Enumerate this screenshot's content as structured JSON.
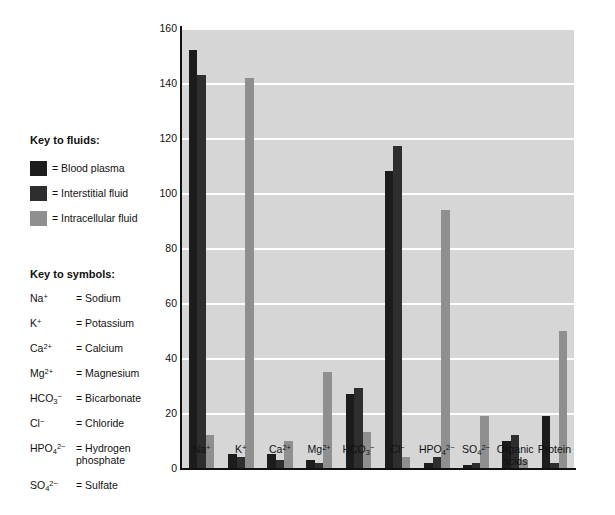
{
  "key_fluids": {
    "heading": "Key to fluids:",
    "items": [
      {
        "label": "= Blood plasma",
        "swatch_name": "blood-plasma-swatch",
        "color": "#1c1c1c"
      },
      {
        "label": "= Interstitial fluid",
        "swatch_name": "interstitial-swatch",
        "color": "#2e2e2e"
      },
      {
        "label": "= Intracellular fluid",
        "swatch_name": "intracellular-swatch",
        "color": "#8f8f8f"
      }
    ]
  },
  "key_symbols": {
    "heading": "Key to symbols:",
    "items": [
      {
        "ion_base": "Na",
        "ion_sup": "+",
        "ion_sub": "",
        "name": "= Sodium"
      },
      {
        "ion_base": "K",
        "ion_sup": "+",
        "ion_sub": "",
        "name": "= Potassium"
      },
      {
        "ion_base": "Ca",
        "ion_sup": "2+",
        "ion_sub": "",
        "name": "= Calcium"
      },
      {
        "ion_base": "Mg",
        "ion_sup": "2+",
        "ion_sub": "",
        "name": "= Magnesium"
      },
      {
        "ion_base": "HCO",
        "ion_sup": "−",
        "ion_sub": "3",
        "name": "= Bicarbonate"
      },
      {
        "ion_base": "Cl",
        "ion_sup": "−",
        "ion_sub": "",
        "name": "= Chloride"
      },
      {
        "ion_base": "HPO",
        "ion_sup": "2−",
        "ion_sub": "4",
        "name": "= Hydrogen\nphosphate"
      },
      {
        "ion_base": "SO",
        "ion_sup": "2−",
        "ion_sub": "4",
        "name": "= Sulfate"
      }
    ]
  },
  "chart_data": {
    "type": "bar",
    "title": "",
    "xlabel": "",
    "ylabel": "Total solute concentration (mEq/L)",
    "ylim": [
      0,
      160
    ],
    "yticks": [
      0,
      20,
      40,
      60,
      80,
      100,
      120,
      140,
      160
    ],
    "grid": true,
    "legend_position": "left-external",
    "categories": [
      "Na⁺",
      "K⁺",
      "Ca²⁺",
      "Mg²⁺",
      "HCO₃⁻",
      "Cl⁻",
      "HPO₄²⁻",
      "SO₄²⁻",
      "Organic\nacids",
      "Protein"
    ],
    "series": [
      {
        "name": "Blood plasma",
        "color": "#1c1c1c",
        "values": [
          152,
          5,
          5,
          3,
          27,
          108,
          2,
          1,
          10,
          19
        ]
      },
      {
        "name": "Interstitial fluid",
        "color": "#2e2e2e",
        "values": [
          143,
          4,
          3,
          2,
          29,
          117,
          4,
          2,
          12,
          2
        ]
      },
      {
        "name": "Intracellular fluid",
        "color": "#8f8f8f",
        "values": [
          12,
          142,
          10,
          35,
          13,
          4,
          94,
          19,
          3,
          50
        ]
      }
    ],
    "plot_background": "#d6d6d6",
    "gridline_color": "#ffffff",
    "axis_color": "#111111"
  }
}
